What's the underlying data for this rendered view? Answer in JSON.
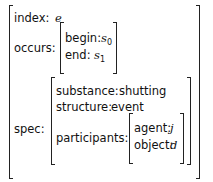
{
  "avm": {
    "index": {
      "label": "index:",
      "value": "e"
    },
    "occurs": {
      "label": "occurs:",
      "begin": {
        "label": "begin:",
        "value": "s",
        "sub": "0"
      },
      "end": {
        "label": "end:",
        "value": "s",
        "sub": "1"
      }
    },
    "spec": {
      "label": "spec:",
      "substance": {
        "label": "substance:",
        "value": "shutting"
      },
      "structure": {
        "label": "structure:",
        "value": "event"
      },
      "participants": {
        "label": "participants:",
        "agent": {
          "label": "agent:",
          "value": "j"
        },
        "object": {
          "label": "object:",
          "value": "d"
        }
      }
    }
  }
}
